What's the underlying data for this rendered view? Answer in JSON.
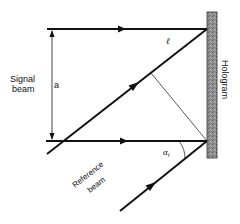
{
  "diagram": {
    "labels": {
      "signal_line1": "Signal",
      "signal_line2": "beam",
      "dimension": "a",
      "path_length": "ℓ",
      "hologram": "Hologram",
      "reference_line1": "Reference",
      "reference_line2": "beam",
      "angle_symbol": "α",
      "angle_subscript": "r"
    },
    "colors": {
      "line": "#111111",
      "hologram_fill": "#8a8a8a",
      "hologram_border": "#333333",
      "background": "#ffffff"
    }
  }
}
